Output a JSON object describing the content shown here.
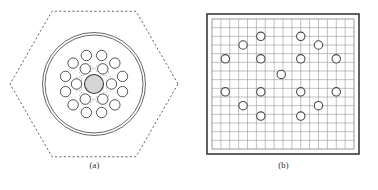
{
  "figure": {
    "width": 378,
    "height": 190,
    "background": "#ffffff",
    "panels": [
      {
        "id": "a",
        "caption": "(a)",
        "title": "photonic-crystal-fiber-cross-section",
        "description": "Hexagonal dashed outer boundary enclosing a double circular cladding ring, a shaded central core, and two concentric rings of air holes with dashed lattice guides.",
        "colors": {
          "outline": "#555555",
          "hole_stroke": "#4a4a4a",
          "core_fill": "#d6d6d6",
          "core_stroke": "#3a3a3a",
          "dashed_guide": "#8a8a8a"
        },
        "hexagon": {
          "center_x": 94,
          "center_y": 84,
          "radius": 84,
          "rotation_deg": 0,
          "stroke_dasharray": "2.2 2.2",
          "stroke_width": 0.9,
          "flat_top": true
        },
        "cladding_rings": [
          {
            "name": "outer-cladding-circle",
            "radius": 51.5,
            "stroke_width": 0.9
          },
          {
            "name": "inner-cladding-circle",
            "radius": 49.0,
            "stroke_width": 0.9
          }
        ],
        "core": {
          "name": "fiber-core",
          "radius": 9.5,
          "fill": "#d6d6d6",
          "stroke": "#3a3a3a",
          "stroke_width": 1.1
        },
        "hole_rings": [
          {
            "name": "inner-hole-ring",
            "count": 6,
            "orbit_radius": 17.5,
            "hole_radius": 5.2,
            "start_angle_deg": 0
          },
          {
            "name": "outer-hole-ring",
            "count": 12,
            "orbit_radius": 29.5,
            "hole_radius": 5.2,
            "start_angle_deg": 15
          }
        ],
        "dashed_guides": {
          "name": "lattice-dashed-guides",
          "count": 12,
          "orbit_radius": 16.0,
          "marker_radius": 3.0,
          "stroke_dasharray": "1.4 1.4"
        }
      },
      {
        "id": "b",
        "caption": "(b)",
        "title": "finite-element-mesh-grid",
        "description": "Square computational domain bounded by a dark frame, filled with a regular rectangular mesh, with circular hole markers at the discretized lattice positions.",
        "colors": {
          "frame": "#3a3a3a",
          "grid_line": "#8e8e8e",
          "marker_stroke": "#4a4a4a",
          "marker_fill": "#ffffff",
          "background": "#ffffff"
        },
        "frame": {
          "x": 18,
          "y": 14,
          "width": 152,
          "height": 140,
          "stroke_width": 1.6,
          "inner_gap": 4
        },
        "mesh": {
          "x": 23,
          "y": 19,
          "width": 142,
          "height": 130,
          "columns": 16,
          "rows": 15,
          "stroke_width": 0.55
        },
        "markers": {
          "radius": 4.2,
          "stroke_width": 1.1,
          "positions": [
            {
              "col": 5.5,
              "row": 2.0
            },
            {
              "col": 10.0,
              "row": 2.0
            },
            {
              "col": 3.5,
              "row": 3.0
            },
            {
              "col": 12.0,
              "row": 3.0
            },
            {
              "col": 1.5,
              "row": 4.6
            },
            {
              "col": 5.5,
              "row": 4.6
            },
            {
              "col": 10.0,
              "row": 4.6
            },
            {
              "col": 14.0,
              "row": 4.6
            },
            {
              "col": 7.8,
              "row": 6.4
            },
            {
              "col": 1.5,
              "row": 8.4
            },
            {
              "col": 5.5,
              "row": 8.4
            },
            {
              "col": 10.0,
              "row": 8.4
            },
            {
              "col": 14.0,
              "row": 8.4
            },
            {
              "col": 3.5,
              "row": 10.0
            },
            {
              "col": 12.0,
              "row": 10.0
            },
            {
              "col": 5.5,
              "row": 11.2
            },
            {
              "col": 10.0,
              "row": 11.2
            }
          ]
        }
      }
    ]
  }
}
